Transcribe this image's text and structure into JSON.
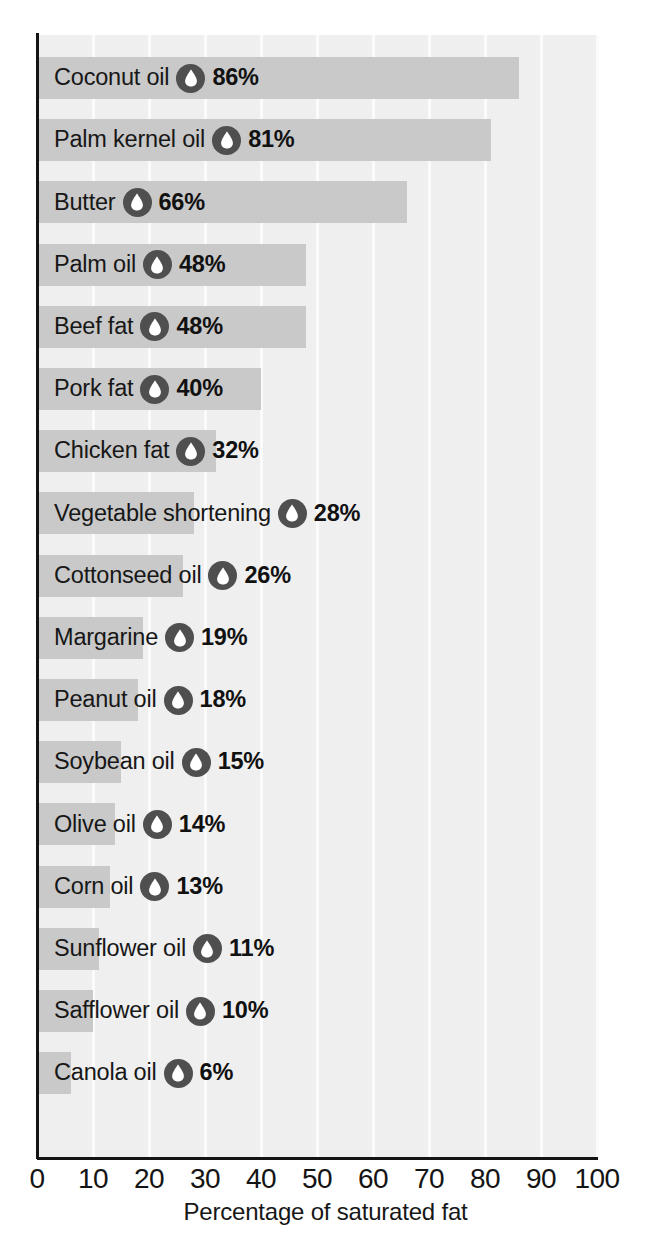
{
  "chart_data": {
    "type": "bar",
    "orientation": "horizontal",
    "title": "",
    "xlabel": "Percentage of saturated fat",
    "ylabel": "",
    "xlim": [
      0,
      100
    ],
    "xticks": [
      "0",
      "10",
      "20",
      "30",
      "40",
      "50",
      "60",
      "70",
      "80",
      "90",
      "100"
    ],
    "grid": "vertical-white-gridlines",
    "legend": "none",
    "value_suffix": "%",
    "categories": [
      "Coconut oil",
      "Palm kernel oil",
      "Butter",
      "Palm oil",
      "Beef fat",
      "Pork fat",
      "Chicken fat",
      "Vegetable shortening",
      "Cottonseed oil",
      "Margarine",
      "Peanut oil",
      "Soybean oil",
      "Olive oil",
      "Corn oil",
      "Sunflower oil",
      "Safflower oil",
      "Canola oil"
    ],
    "values": [
      86,
      81,
      66,
      48,
      48,
      40,
      32,
      28,
      26,
      19,
      18,
      15,
      14,
      13,
      11,
      10,
      6
    ],
    "bars": [
      {
        "label": "Coconut oil",
        "value": 86,
        "value_label": "86%"
      },
      {
        "label": "Palm kernel oil",
        "value": 81,
        "value_label": "81%"
      },
      {
        "label": "Butter",
        "value": 66,
        "value_label": "66%"
      },
      {
        "label": "Palm oil",
        "value": 48,
        "value_label": "48%"
      },
      {
        "label": "Beef fat",
        "value": 48,
        "value_label": "48%"
      },
      {
        "label": "Pork fat",
        "value": 40,
        "value_label": "40%"
      },
      {
        "label": "Chicken fat",
        "value": 32,
        "value_label": "32%"
      },
      {
        "label": "Vegetable shortening",
        "value": 28,
        "value_label": "28%"
      },
      {
        "label": "Cottonseed oil",
        "value": 26,
        "value_label": "26%"
      },
      {
        "label": "Margarine",
        "value": 19,
        "value_label": "19%"
      },
      {
        "label": "Peanut oil",
        "value": 18,
        "value_label": "18%"
      },
      {
        "label": "Soybean oil",
        "value": 15,
        "value_label": "15%"
      },
      {
        "label": "Olive oil",
        "value": 14,
        "value_label": "14%"
      },
      {
        "label": "Corn oil",
        "value": 13,
        "value_label": "13%"
      },
      {
        "label": "Sunflower oil",
        "value": 11,
        "value_label": "11%"
      },
      {
        "label": "Safflower oil",
        "value": 10,
        "value_label": "10%"
      },
      {
        "label": "Canola oil",
        "value": 6,
        "value_label": "6%"
      }
    ],
    "icon": "oil-droplet-icon",
    "colors": {
      "bar": "#c9c9c9",
      "plot_background": "#efefef",
      "gridline": "#fbfbfb",
      "axis": "#141414",
      "text": "#171717",
      "icon_circle": "#4f4f4f",
      "icon_droplet": "#ffffff"
    }
  }
}
